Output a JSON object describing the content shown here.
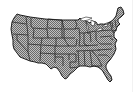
{
  "map": {
    "title": "United States",
    "region": "contiguous-us",
    "fill_color": "#a8a8a8",
    "pattern_dark": "#6e6e6e",
    "pattern_light": "#c4c4c4",
    "border_color": "#222222",
    "lakes_color": "#ffffff",
    "background": "#ffffff"
  }
}
